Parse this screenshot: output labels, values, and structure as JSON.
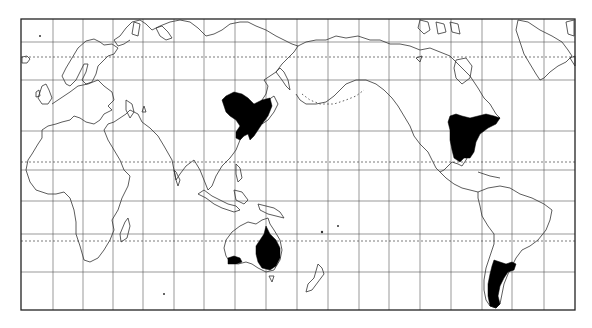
{
  "map": {
    "type": "world distribution map",
    "projection": "Mercator, Pacific-centered",
    "frame": {
      "x": 21,
      "y": 19,
      "width": 554,
      "height": 291
    },
    "meridian_lines_x": [
      53,
      83,
      113,
      143,
      174,
      204,
      235,
      266,
      297,
      328,
      359,
      389,
      420,
      451,
      482,
      512,
      544
    ],
    "parallel_lines_y": [
      42,
      80,
      131,
      170,
      201,
      234,
      272
    ],
    "special_parallels": [
      {
        "name": "Arctic Circle",
        "y": 57,
        "style": "dotted"
      },
      {
        "name": "Tropic of Cancer",
        "y": 162,
        "style": "dotted"
      },
      {
        "name": "Tropic of Capricorn",
        "y": 241,
        "style": "dotted"
      }
    ],
    "colors": {
      "background": "#ffffff",
      "land_outline": "#333333",
      "range_fill": "#000000",
      "grid": "#555555"
    },
    "distribution_regions": [
      {
        "name": "East Asia (Manchuria / China / Korea)"
      },
      {
        "name": "Eastern North America"
      },
      {
        "name": "Eastern and South-western Australia"
      },
      {
        "name": "Southern South America (Argentina / Chile)"
      }
    ],
    "continents": [
      "Europe",
      "Africa",
      "Asia",
      "Australia",
      "New Zealand",
      "North America",
      "Greenland",
      "South America"
    ]
  }
}
